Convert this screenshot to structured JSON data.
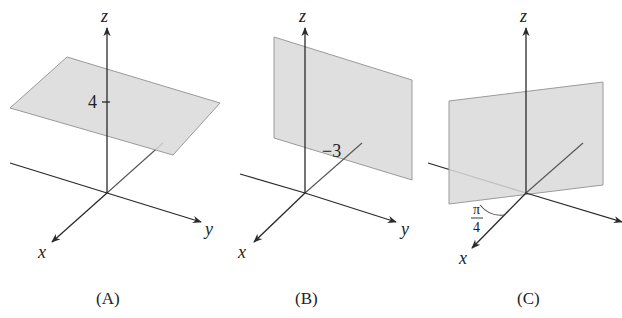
{
  "figure": {
    "panels": [
      {
        "id": "A",
        "caption": "(A)",
        "axes": {
          "x": "x",
          "y": "y",
          "z": "z"
        },
        "plane": "horizontal plane z = 4",
        "label": "4"
      },
      {
        "id": "B",
        "caption": "(B)",
        "axes": {
          "x": "x",
          "y": "y",
          "z": "z"
        },
        "plane": "vertical plane y = -3",
        "label": "−3"
      },
      {
        "id": "C",
        "caption": "(C)",
        "axes": {
          "x": "x",
          "y": "y",
          "z": "z"
        },
        "plane": "vertical plane through z-axis at angle pi/4",
        "angle_label_num": "π",
        "angle_label_den": "4"
      }
    ]
  },
  "colors": {
    "plane_fill": "#d9d9d9",
    "axis": "#2a2a2a"
  }
}
